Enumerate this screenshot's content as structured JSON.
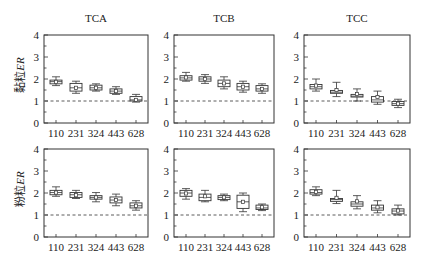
{
  "figure": {
    "row_labels": [
      {
        "prefix": "黏粒",
        "italic": "ER"
      },
      {
        "prefix": "粉粒",
        "italic": "ER"
      }
    ],
    "column_titles": [
      "TCA",
      "TCB",
      "TCC"
    ],
    "reference_line": 1
  },
  "chart_data": [
    {
      "type": "box",
      "title": "TCA",
      "ylabel": "黏粒ER",
      "row": 0,
      "col": 0,
      "categories": [
        "110",
        "231",
        "324",
        "443",
        "628"
      ],
      "ylim": [
        0,
        4
      ],
      "yticks": [
        0,
        1,
        2,
        3,
        4
      ],
      "reference_line": 1,
      "boxes": [
        {
          "min": 1.7,
          "q1": 1.78,
          "median": 1.88,
          "q3": 1.95,
          "max": 2.1,
          "mean": 1.87
        },
        {
          "min": 1.35,
          "q1": 1.45,
          "median": 1.6,
          "q3": 1.8,
          "max": 1.9,
          "mean": 1.6
        },
        {
          "min": 1.45,
          "q1": 1.5,
          "median": 1.6,
          "q3": 1.72,
          "max": 1.78,
          "mean": 1.6
        },
        {
          "min": 1.3,
          "q1": 1.35,
          "median": 1.45,
          "q3": 1.55,
          "max": 1.65,
          "mean": 1.45
        },
        {
          "min": 0.95,
          "q1": 1.0,
          "median": 1.05,
          "q3": 1.2,
          "max": 1.3,
          "mean": 1.05
        }
      ]
    },
    {
      "type": "box",
      "title": "TCB",
      "ylabel": "黏粒ER",
      "row": 0,
      "col": 1,
      "categories": [
        "110",
        "231",
        "324",
        "443",
        "628"
      ],
      "ylim": [
        0,
        4
      ],
      "yticks": [
        0,
        1,
        2,
        3,
        4
      ],
      "reference_line": 1,
      "boxes": [
        {
          "min": 1.9,
          "q1": 1.95,
          "median": 2.05,
          "q3": 2.15,
          "max": 2.3,
          "mean": 2.07
        },
        {
          "min": 1.8,
          "q1": 1.9,
          "median": 2.0,
          "q3": 2.1,
          "max": 2.2,
          "mean": 2.0
        },
        {
          "min": 1.55,
          "q1": 1.65,
          "median": 1.8,
          "q3": 1.95,
          "max": 2.1,
          "mean": 1.8
        },
        {
          "min": 1.4,
          "q1": 1.5,
          "median": 1.65,
          "q3": 1.8,
          "max": 1.9,
          "mean": 1.65
        },
        {
          "min": 1.35,
          "q1": 1.45,
          "median": 1.55,
          "q3": 1.7,
          "max": 1.78,
          "mean": 1.55
        }
      ]
    },
    {
      "type": "box",
      "title": "TCC",
      "ylabel": "黏粒ER",
      "row": 0,
      "col": 2,
      "categories": [
        "110",
        "231",
        "324",
        "443",
        "628"
      ],
      "ylim": [
        0,
        4
      ],
      "yticks": [
        0,
        1,
        2,
        3,
        4
      ],
      "reference_line": 1,
      "boxes": [
        {
          "min": 1.45,
          "q1": 1.55,
          "median": 1.65,
          "q3": 1.75,
          "max": 2.0,
          "mean": 1.7
        },
        {
          "min": 1.2,
          "q1": 1.35,
          "median": 1.4,
          "q3": 1.48,
          "max": 1.85,
          "mean": 1.5
        },
        {
          "min": 1.0,
          "q1": 1.18,
          "median": 1.22,
          "q3": 1.3,
          "max": 1.55,
          "mean": 1.32
        },
        {
          "min": 0.85,
          "q1": 0.95,
          "median": 1.05,
          "q3": 1.2,
          "max": 1.45,
          "mean": 1.18
        },
        {
          "min": 0.7,
          "q1": 0.8,
          "median": 0.88,
          "q3": 0.98,
          "max": 1.08,
          "mean": 0.88
        }
      ]
    },
    {
      "type": "box",
      "title": "TCA",
      "ylabel": "粉粒ER",
      "row": 1,
      "col": 0,
      "categories": [
        "110",
        "231",
        "324",
        "443",
        "628"
      ],
      "ylim": [
        0,
        4
      ],
      "yticks": [
        0,
        1,
        2,
        3,
        4
      ],
      "reference_line": 1,
      "boxes": [
        {
          "min": 1.85,
          "q1": 1.92,
          "median": 2.02,
          "q3": 2.12,
          "max": 2.28,
          "mean": 2.02
        },
        {
          "min": 1.75,
          "q1": 1.8,
          "median": 1.92,
          "q3": 2.02,
          "max": 2.12,
          "mean": 1.9
        },
        {
          "min": 1.6,
          "q1": 1.72,
          "median": 1.8,
          "q3": 1.88,
          "max": 2.02,
          "mean": 1.8
        },
        {
          "min": 1.42,
          "q1": 1.55,
          "median": 1.68,
          "q3": 1.82,
          "max": 1.95,
          "mean": 1.68
        },
        {
          "min": 1.22,
          "q1": 1.32,
          "median": 1.42,
          "q3": 1.55,
          "max": 1.65,
          "mean": 1.42
        }
      ]
    },
    {
      "type": "box",
      "title": "TCB",
      "ylabel": "粉粒ER",
      "row": 1,
      "col": 1,
      "categories": [
        "110",
        "231",
        "324",
        "443",
        "628"
      ],
      "ylim": [
        0,
        4
      ],
      "yticks": [
        0,
        1,
        2,
        3,
        4
      ],
      "reference_line": 1,
      "boxes": [
        {
          "min": 1.72,
          "q1": 1.85,
          "median": 2.0,
          "q3": 2.12,
          "max": 2.2,
          "mean": 1.98
        },
        {
          "min": 1.6,
          "q1": 1.65,
          "median": 1.8,
          "q3": 1.95,
          "max": 2.12,
          "mean": 1.85
        },
        {
          "min": 1.65,
          "q1": 1.7,
          "median": 1.8,
          "q3": 1.88,
          "max": 1.95,
          "mean": 1.8
        },
        {
          "min": 1.15,
          "q1": 1.3,
          "median": 1.6,
          "q3": 1.9,
          "max": 2.0,
          "mean": 1.6
        },
        {
          "min": 1.2,
          "q1": 1.25,
          "median": 1.32,
          "q3": 1.45,
          "max": 1.5,
          "mean": 1.35
        }
      ]
    },
    {
      "type": "box",
      "title": "TCC",
      "ylabel": "粉粒ER",
      "row": 1,
      "col": 2,
      "categories": [
        "110",
        "231",
        "324",
        "443",
        "628"
      ],
      "ylim": [
        0,
        4
      ],
      "yticks": [
        0,
        1,
        2,
        3,
        4
      ],
      "reference_line": 1,
      "boxes": [
        {
          "min": 1.88,
          "q1": 1.95,
          "median": 2.02,
          "q3": 2.15,
          "max": 2.28,
          "mean": 2.05
        },
        {
          "min": 1.52,
          "q1": 1.62,
          "median": 1.7,
          "q3": 1.75,
          "max": 2.12,
          "mean": 1.78
        },
        {
          "min": 1.28,
          "q1": 1.4,
          "median": 1.5,
          "q3": 1.6,
          "max": 1.88,
          "mean": 1.62
        },
        {
          "min": 1.1,
          "q1": 1.22,
          "median": 1.32,
          "q3": 1.45,
          "max": 1.65,
          "mean": 1.35
        },
        {
          "min": 1.0,
          "q1": 1.05,
          "median": 1.18,
          "q3": 1.28,
          "max": 1.45,
          "mean": 1.2
        }
      ]
    }
  ]
}
